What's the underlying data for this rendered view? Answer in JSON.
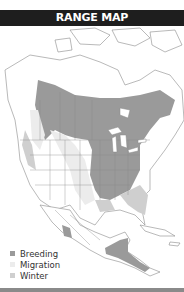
{
  "header": {
    "title": "RANGE MAP"
  },
  "legend": {
    "items": [
      {
        "label": "Breeding",
        "color": "#9a9a9a"
      },
      {
        "label": "Migration",
        "color": "#ececec"
      },
      {
        "label": "Winter",
        "color": "#cfcfcf"
      }
    ]
  },
  "colors": {
    "header_bg": "#1e1e1e",
    "land": "#ffffff",
    "water": "#ffffff",
    "border": "#8a8a8a",
    "breeding": "#9a9a9a",
    "migration": "#ececec",
    "winter": "#cfcfcf"
  }
}
